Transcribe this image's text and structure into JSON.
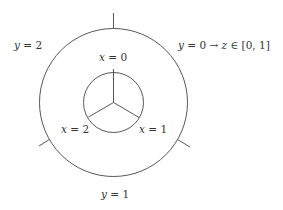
{
  "diagram": {
    "stroke_color": "#444444",
    "background": "#ffffff",
    "outer_circle": {
      "cx": 113.5,
      "cy": 102.5,
      "r": 74
    },
    "inner_circle": {
      "cx": 113.5,
      "cy": 102.5,
      "r": 30
    },
    "labels": {
      "y2": {
        "var": "y",
        "eq": " = 2"
      },
      "y0": {
        "var": "y",
        "eq": " = 0 → ",
        "var2": "z",
        "rest": " ∈ [0, 1]"
      },
      "y1": {
        "var": "y",
        "eq": " = 1"
      },
      "x0": {
        "var": "x",
        "eq": " = 0"
      },
      "x1": {
        "var": "x",
        "eq": " = 1"
      },
      "x2": {
        "var": "x",
        "eq": " = 2"
      }
    }
  }
}
